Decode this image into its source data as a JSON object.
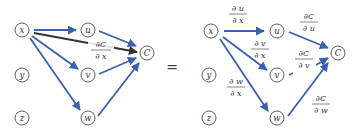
{
  "diagram": {
    "colors": {
      "edge_blue": "#3a60b0",
      "edge_dark": "#333333",
      "node_stroke": "#333333"
    },
    "equals_sign": "=",
    "left_panel": {
      "nodes": {
        "x": "x",
        "y": "y",
        "z": "z",
        "u": "u",
        "v": "v",
        "w": "w",
        "C": "C"
      },
      "total_derivative_label": {
        "numerator": "∂C",
        "denominator": "∂ x"
      },
      "edges": [
        {
          "from": "x",
          "to": "u",
          "color": "blue"
        },
        {
          "from": "x",
          "to": "v",
          "color": "blue"
        },
        {
          "from": "x",
          "to": "w",
          "color": "blue"
        },
        {
          "from": "x",
          "to": "C",
          "color": "dark"
        },
        {
          "from": "u",
          "to": "C",
          "color": "blue"
        },
        {
          "from": "v",
          "to": "C",
          "color": "blue"
        },
        {
          "from": "w",
          "to": "C",
          "color": "blue"
        }
      ]
    },
    "right_panel": {
      "nodes": {
        "x": "x",
        "y": "y",
        "z": "z",
        "u": "u",
        "v": "v",
        "w": "w",
        "C": "C"
      },
      "edge_labels": {
        "du_dx": {
          "numerator": "∂ u",
          "denominator": "∂ x"
        },
        "dv_dx": {
          "numerator": "∂ v",
          "denominator": "∂ x"
        },
        "dw_dx": {
          "numerator": "∂ w",
          "denominator": "∂ x"
        },
        "dC_du": {
          "numerator": "∂C",
          "denominator": "∂ u"
        },
        "dC_dv": {
          "numerator": "∂C",
          "denominator": "∂ v"
        },
        "dC_dw": {
          "numerator": "∂C",
          "denominator": "∂ w"
        }
      }
    }
  }
}
